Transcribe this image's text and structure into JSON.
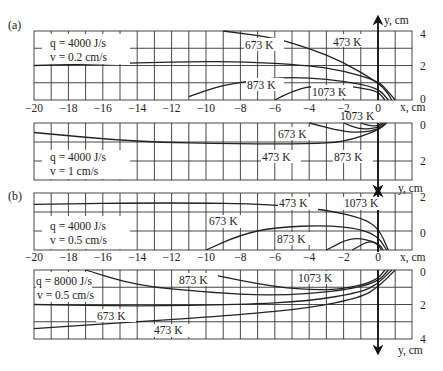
{
  "figure": {
    "panel_labels": [
      "(a)",
      "(b)"
    ],
    "x_axis_label": "x, cm",
    "y_axis_label": "y, cm",
    "x_ticks": [
      "-20",
      "-18",
      "-16",
      "-14",
      "-12",
      "-10",
      "-8",
      "-6",
      "-4",
      "-2",
      "0"
    ],
    "panels": [
      {
        "id": "a1",
        "q": "q = 4000 J/s",
        "v": "v = 0.2 cm/s",
        "y_ticks": [
          "4",
          "2",
          "0"
        ],
        "direction": "up"
      },
      {
        "id": "a2",
        "q": "q = 4000 J/s",
        "v": "v = 1 cm/s",
        "y_ticks": [
          "0",
          "2"
        ],
        "direction": "down"
      },
      {
        "id": "b1",
        "q": "q = 4000 J/s",
        "v": "v = 0.5 cm/s",
        "y_ticks": [
          "2",
          "0"
        ],
        "direction": "up"
      },
      {
        "id": "b2",
        "q": "q = 8000 J/s",
        "v": "v = 0.5 cm/s",
        "y_ticks": [
          "0",
          "2",
          "4"
        ],
        "direction": "down"
      }
    ],
    "isotherm_labels": {
      "a1": [
        "673 K",
        "473 K",
        "873 K",
        "1073 K"
      ],
      "a2": [
        "1073 K",
        "673 K",
        "473 K",
        "873 K"
      ],
      "b1": [
        "473 K",
        "1073 K",
        "673 K",
        "873 K"
      ],
      "b2": [
        "873 K",
        "1073 K",
        "673 K",
        "473 K"
      ]
    }
  },
  "chart_data": [
    {
      "type": "line",
      "title": "(a) q = 4000 J/s, v = 0.2 cm/s",
      "xlabel": "x, cm",
      "ylabel": "y, cm",
      "xlim": [
        -20,
        2
      ],
      "ylim": [
        0,
        4
      ],
      "grid": true,
      "series": [
        {
          "name": "473 K",
          "x": [
            -20,
            -16,
            -12,
            -8,
            -4,
            -2,
            0,
            0.5,
            1
          ],
          "y": [
            2.0,
            2.1,
            2.2,
            2.25,
            2.0,
            1.7,
            1.1,
            0.6,
            0
          ]
        },
        {
          "name": "673 K",
          "x": [
            -9,
            -6,
            -4,
            -2,
            0,
            0.5,
            0.8
          ],
          "y": [
            4.2,
            3.6,
            3.0,
            2.2,
            1.0,
            0.5,
            0
          ]
        },
        {
          "name": "873 K",
          "x": [
            -11,
            -9,
            -6,
            -4,
            -2,
            0,
            0.6
          ],
          "y": [
            0.2,
            0.9,
            1.3,
            1.3,
            1.1,
            0.7,
            0
          ]
        },
        {
          "name": "1073 K",
          "x": [
            -6,
            -5,
            -4,
            -2,
            -1,
            0,
            0.4
          ],
          "y": [
            0,
            0.5,
            0.8,
            0.85,
            0.7,
            0.5,
            0
          ]
        }
      ]
    },
    {
      "type": "line",
      "title": "(a) q = 4000 J/s, v = 1 cm/s",
      "xlabel": "x, cm",
      "ylabel": "y, cm",
      "xlim": [
        -20,
        2
      ],
      "ylim": [
        0,
        3
      ],
      "grid": true,
      "series": [
        {
          "name": "473 K",
          "x": [
            -20,
            -14,
            -8,
            -4,
            -2,
            0,
            0.5
          ],
          "y": [
            0.5,
            1.0,
            1.1,
            1.1,
            1.0,
            0.4,
            0
          ]
        },
        {
          "name": "673 K",
          "x": [
            -4,
            -2,
            -1,
            0,
            0.4
          ],
          "y": [
            0,
            0.45,
            0.5,
            0.35,
            0
          ]
        },
        {
          "name": "873 K",
          "x": [
            -2,
            -1,
            0,
            0.3
          ],
          "y": [
            0,
            0.35,
            0.25,
            0
          ]
        },
        {
          "name": "1073 K",
          "x": [
            -1,
            -0.5,
            0,
            0.2
          ],
          "y": [
            0,
            0.15,
            0.15,
            0
          ]
        }
      ]
    },
    {
      "type": "line",
      "title": "(b) q = 4000 J/s, v = 0.5 cm/s",
      "xlabel": "x, cm",
      "ylabel": "y, cm",
      "xlim": [
        -20,
        2
      ],
      "ylim": [
        -1,
        2
      ],
      "grid": true,
      "series": [
        {
          "name": "473 K",
          "x": [
            -20,
            -12,
            -6,
            -3,
            -1,
            0,
            0.6
          ],
          "y": [
            1.4,
            1.5,
            1.4,
            1.1,
            0.7,
            0.2,
            -1
          ]
        },
        {
          "name": "673 K",
          "x": [
            -10,
            -8,
            -6,
            -3,
            -1,
            0,
            0.5
          ],
          "y": [
            -1,
            -0.2,
            0.2,
            0.3,
            0.1,
            -0.3,
            -1
          ]
        },
        {
          "name": "873 K",
          "x": [
            -3,
            -1.5,
            0,
            0.3
          ],
          "y": [
            -1,
            -0.3,
            -0.6,
            -1
          ]
        },
        {
          "name": "1073 K",
          "x": [
            -1.5,
            -0.5,
            0,
            0.2
          ],
          "y": [
            -1,
            -0.5,
            -0.7,
            -1
          ]
        }
      ]
    },
    {
      "type": "line",
      "title": "(b) q = 8000 J/s, v = 0.5 cm/s",
      "xlabel": "x, cm",
      "ylabel": "y, cm",
      "xlim": [
        -20,
        2
      ],
      "ylim": [
        0,
        4
      ],
      "grid": true,
      "series": [
        {
          "name": "473 K",
          "x": [
            -20,
            -14,
            -8,
            -4,
            -1,
            0,
            1
          ],
          "y": [
            3.4,
            3.0,
            2.6,
            2.2,
            1.6,
            1.0,
            0
          ]
        },
        {
          "name": "673 K",
          "x": [
            -20,
            -14,
            -8,
            -4,
            -1,
            0,
            0.8
          ],
          "y": [
            2.0,
            2.1,
            2.0,
            1.8,
            1.3,
            0.8,
            0
          ]
        },
        {
          "name": "873 K",
          "x": [
            -17,
            -14,
            -10,
            -6,
            -2,
            0,
            0.6
          ],
          "y": [
            0,
            0.9,
            1.3,
            1.5,
            1.2,
            0.7,
            0
          ]
        },
        {
          "name": "1073 K",
          "x": [
            -10,
            -6,
            -3,
            -1,
            0,
            0.4
          ],
          "y": [
            0.2,
            1.0,
            1.2,
            0.9,
            0.5,
            0
          ]
        }
      ]
    }
  ]
}
